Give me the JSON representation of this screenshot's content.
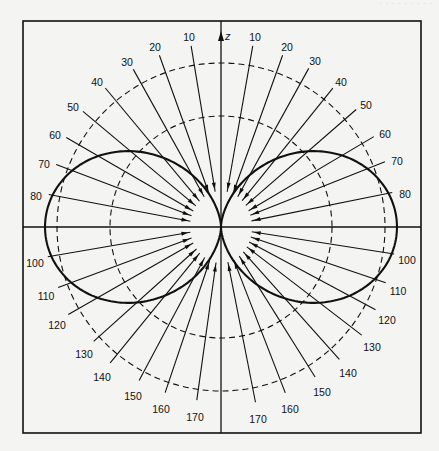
{
  "header": {
    "text": "· · ·   · · · · · ·"
  },
  "figure": {
    "axis_label": "z",
    "center": [
      221,
      227
    ],
    "frame": {
      "x": 23,
      "y": 21,
      "width": 398,
      "height": 412
    },
    "colors": {
      "ink": "#111111",
      "paper": "#f4f4f2"
    }
  },
  "chart_data": {
    "type": "polar-radiation-pattern",
    "title": "",
    "axis": "z",
    "pattern": "dipole-like lobes, r ∝ sin^1.5(θ), symmetric about z-axis",
    "lobe_max_radius_px": 176,
    "dashed_circles_radius_px": [
      111,
      164
    ],
    "inner_clear_ellipse_px": {
      "rx": 31,
      "ry": 36
    },
    "angle_labels_deg": [
      10,
      20,
      30,
      40,
      50,
      60,
      70,
      80,
      100,
      110,
      120,
      130,
      140,
      150,
      160,
      170
    ],
    "left_labels": [
      {
        "text": "10",
        "x": 189,
        "y": 37
      },
      {
        "text": "20",
        "x": 155,
        "y": 47
      },
      {
        "text": "30",
        "x": 127,
        "y": 62
      },
      {
        "text": "40",
        "x": 97,
        "y": 82
      },
      {
        "text": "50",
        "x": 73,
        "y": 107
      },
      {
        "text": "60",
        "x": 55,
        "y": 135
      },
      {
        "text": "70",
        "x": 44,
        "y": 164
      },
      {
        "text": "80",
        "x": 36,
        "y": 196
      },
      {
        "text": "100",
        "x": 35,
        "y": 263
      },
      {
        "text": "110",
        "x": 46,
        "y": 296
      },
      {
        "text": "120",
        "x": 57,
        "y": 325
      },
      {
        "text": "130",
        "x": 84,
        "y": 354
      },
      {
        "text": "140",
        "x": 102,
        "y": 377
      },
      {
        "text": "150",
        "x": 133,
        "y": 396
      },
      {
        "text": "160",
        "x": 161,
        "y": 409
      },
      {
        "text": "170",
        "x": 195,
        "y": 417
      }
    ],
    "right_labels": [
      {
        "text": "10",
        "x": 255,
        "y": 37
      },
      {
        "text": "20",
        "x": 287,
        "y": 47
      },
      {
        "text": "30",
        "x": 315,
        "y": 61
      },
      {
        "text": "40",
        "x": 341,
        "y": 82
      },
      {
        "text": "50",
        "x": 366,
        "y": 105
      },
      {
        "text": "60",
        "x": 385,
        "y": 134
      },
      {
        "text": "70",
        "x": 397,
        "y": 161
      },
      {
        "text": "80",
        "x": 405,
        "y": 194
      },
      {
        "text": "100",
        "x": 407,
        "y": 260
      },
      {
        "text": "110",
        "x": 398,
        "y": 291
      },
      {
        "text": "120",
        "x": 387,
        "y": 320
      },
      {
        "text": "130",
        "x": 372,
        "y": 347
      },
      {
        "text": "140",
        "x": 348,
        "y": 373
      },
      {
        "text": "150",
        "x": 322,
        "y": 392
      },
      {
        "text": "160",
        "x": 290,
        "y": 409
      },
      {
        "text": "170",
        "x": 258,
        "y": 419
      }
    ]
  }
}
